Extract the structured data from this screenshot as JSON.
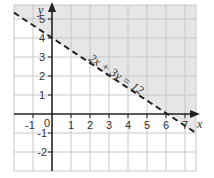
{
  "graph": {
    "x_axis_label": "x",
    "y_axis_label": "y",
    "x_ticks": [
      "-1",
      "1",
      "2",
      "3",
      "4",
      "5",
      "6",
      "7"
    ],
    "y_ticks": [
      "5",
      "4",
      "3",
      "2",
      "1",
      "-1",
      "-2"
    ],
    "origin_label": "0",
    "line_equation": "2x + 3y = 12",
    "line_style": "dashed",
    "shaded_region": "2x + 3y > 12",
    "colors": {
      "shade": "#e6e6e6",
      "grid": "#c8c8c8",
      "axis": "#222222",
      "line": "#222222"
    }
  }
}
